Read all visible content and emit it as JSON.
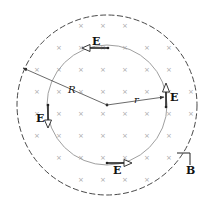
{
  "diagram": {
    "type": "physics-induced-electric-field",
    "colors": {
      "outer_circle": "#333333",
      "inner_circle": "#a0a0a0",
      "cross": "#a8a8a8",
      "vector": "#222222",
      "background": "#ffffff"
    },
    "outer_region": {
      "center": [
        107,
        105
      ],
      "radius": 90,
      "style": "dashed"
    },
    "inner_path": {
      "center": [
        107,
        105
      ],
      "radius": 60,
      "style": "solid"
    },
    "labels": {
      "R": "R",
      "r": "r",
      "E_top": "E",
      "E_right": "E",
      "E_bottom": "E",
      "E_left": "E",
      "B": "B"
    },
    "magnetic_field": {
      "direction": "into page",
      "symbol": "×",
      "grid_spacing": 22
    },
    "e_vectors": [
      {
        "position": "top",
        "direction": "left"
      },
      {
        "position": "right",
        "direction": "up"
      },
      {
        "position": "bottom",
        "direction": "right"
      },
      {
        "position": "left",
        "direction": "down"
      }
    ]
  }
}
